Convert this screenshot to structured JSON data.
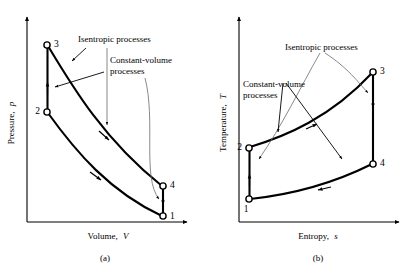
{
  "figure": {
    "kind": "thermodynamic-cycle-diagrams",
    "colors": {
      "ink": "#000000",
      "leader": "#6b6b6b",
      "background": "#ffffff"
    }
  },
  "panels": [
    {
      "id": "a",
      "caption": "(a)",
      "x_axis_label": "Volume, V",
      "x_axis_label_plain": "Volume,",
      "x_axis_label_italic": "V",
      "y_axis_label": "Pressure, p",
      "y_axis_label_plain": "Pressure,",
      "y_axis_label_italic": "p",
      "annotations": {
        "isentropic": "Isentropic processes",
        "constant_volume_line1": "Constant-volume",
        "constant_volume_line2": "processes"
      },
      "state_points": [
        {
          "label": "1",
          "x": 163,
          "y": 216
        },
        {
          "label": "2",
          "x": 47,
          "y": 112
        },
        {
          "label": "3",
          "x": 47,
          "y": 45
        },
        {
          "label": "4",
          "x": 163,
          "y": 186
        }
      ],
      "processes": [
        {
          "from": "1",
          "to": "2",
          "type": "constant-volume",
          "shape": "vertical"
        },
        {
          "from": "2",
          "to": "1",
          "type": "isentropic",
          "shape": "curve-lower"
        },
        {
          "from": "3",
          "to": "4",
          "type": "isentropic",
          "shape": "curve-upper"
        },
        {
          "from": "4",
          "to": "3",
          "type": "constant-volume",
          "shape": "vertical"
        }
      ]
    },
    {
      "id": "b",
      "caption": "(b)",
      "x_axis_label": "Entropy, s",
      "x_axis_label_plain": "Entropy,",
      "x_axis_label_italic": "s",
      "y_axis_label": "Temperature, T",
      "y_axis_label_plain": "Temperature,",
      "y_axis_label_italic": "T",
      "annotations": {
        "isentropic": "Isentropic processes",
        "constant_volume_line1": "Constant-volume",
        "constant_volume_line2": "processes"
      },
      "state_points": [
        {
          "label": "1",
          "x": 249,
          "y": 199
        },
        {
          "label": "2",
          "x": 249,
          "y": 148
        },
        {
          "label": "3",
          "x": 373,
          "y": 72
        },
        {
          "label": "4",
          "x": 373,
          "y": 164
        }
      ],
      "processes": [
        {
          "from": "1",
          "to": "2",
          "type": "isentropic",
          "shape": "vertical"
        },
        {
          "from": "2",
          "to": "3",
          "type": "constant-volume",
          "shape": "curve-upper"
        },
        {
          "from": "3",
          "to": "4",
          "type": "isentropic",
          "shape": "vertical"
        },
        {
          "from": "4",
          "to": "1",
          "type": "constant-volume",
          "shape": "curve-lower"
        }
      ]
    }
  ]
}
